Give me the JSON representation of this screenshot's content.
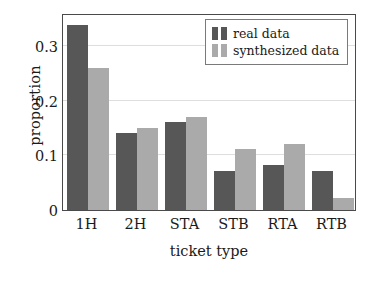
{
  "chart_data": {
    "type": "bar",
    "title": "",
    "xlabel": "ticket type",
    "ylabel": "proportion",
    "categories": [
      "1H",
      "2H",
      "STA",
      "STB",
      "RTA",
      "RTB"
    ],
    "series": [
      {
        "name": "real data",
        "color": "#575757",
        "values": [
          0.338,
          0.14,
          0.16,
          0.071,
          0.083,
          0.072
        ]
      },
      {
        "name": "synthesized data",
        "color": "#aaaaaa",
        "values": [
          0.26,
          0.15,
          0.17,
          0.111,
          0.121,
          0.022
        ]
      }
    ],
    "ylim": [
      0,
      0.36
    ],
    "yticks": [
      0,
      0.1,
      0.2,
      0.3
    ],
    "ytick_labels": [
      "0",
      "0.1",
      "0.2",
      "0.3"
    ],
    "grid": "horizontal",
    "legend_position": "top-right",
    "frame": true
  },
  "legend": {
    "entries": [
      {
        "label": "real data",
        "color": "#575757"
      },
      {
        "label": "synthesized data",
        "color": "#aaaaaa"
      }
    ]
  },
  "axes": {
    "x_title": "ticket type",
    "y_title": "proportion"
  }
}
